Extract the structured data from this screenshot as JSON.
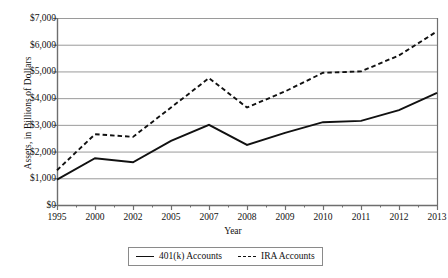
{
  "chart_data": {
    "type": "line",
    "title": "",
    "xlabel": "Year",
    "ylabel": "Assets, in Billions of Dollars",
    "categories": [
      "1995",
      "2000",
      "2002",
      "2005",
      "2007",
      "2008",
      "2009",
      "2010",
      "2011",
      "2012",
      "2013"
    ],
    "ylim": [
      0,
      7000
    ],
    "ytick_labels": [
      "$0",
      "$1,000",
      "$2,000",
      "$3,000",
      "$4,000",
      "$5,000",
      "$6,000",
      "$7,000"
    ],
    "ytick_values": [
      0,
      1000,
      2000,
      3000,
      4000,
      5000,
      6000,
      7000
    ],
    "grid": "horizontal",
    "legend_position": "bottom",
    "series": [
      {
        "name": "401(k) Accounts",
        "style": "solid",
        "color": "#111111",
        "values": [
          950,
          1750,
          1600,
          2400,
          3000,
          2250,
          2700,
          3100,
          3150,
          3550,
          4200
        ]
      },
      {
        "name": "IRA Accounts",
        "style": "dashed",
        "color": "#111111",
        "values": [
          1300,
          2650,
          2550,
          3650,
          4750,
          3650,
          4250,
          4950,
          5000,
          5600,
          6500
        ]
      }
    ]
  },
  "legend": {
    "items": [
      {
        "label": "401(k) Accounts",
        "style": "solid"
      },
      {
        "label": "IRA Accounts",
        "style": "dashed"
      }
    ]
  },
  "axes": {
    "x_title": "Year",
    "y_title": "Assets, in Billions of Dollars"
  },
  "colors": {
    "gridline": "#9a9a9a",
    "axis": "#6e6e6e",
    "series": "#111111",
    "background": "#ffffff"
  }
}
